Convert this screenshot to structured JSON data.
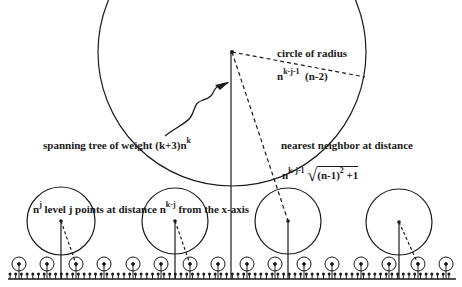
{
  "figure": {
    "big_circle": {
      "cx": 232,
      "cy": 52,
      "r": 134
    },
    "medium_circles": [
      {
        "cx": 61,
        "cy": 221,
        "r": 34
      },
      {
        "cx": 175,
        "cy": 221,
        "r": 33
      },
      {
        "cx": 288,
        "cy": 221,
        "r": 33
      },
      {
        "cx": 399,
        "cy": 222,
        "r": 33
      }
    ],
    "small_circle_centers_x": [
      19,
      47,
      76,
      104,
      133,
      161,
      190,
      218,
      247,
      275,
      304,
      332,
      361,
      389,
      418,
      446
    ],
    "small_circle": {
      "cy": 264,
      "r": 7
    },
    "axis": {
      "y": 279,
      "x1": 8,
      "x2": 456
    },
    "ticks": {
      "spacing": 5.7,
      "top_y": 274
    }
  },
  "labels": {
    "circle_of_radius": "circle of radius",
    "radius_n": "n",
    "radius_exp": "k-j-1",
    "radius_factor": "(n-2)",
    "spanning_tree": "spanning tree of weight (k+3)n",
    "spanning_exp": "k",
    "nearest_neighbor": "nearest  neighbor at distance",
    "nn_n": "n",
    "nn_exp": "k-j-1",
    "nn_sqrt_body": "(n-1)",
    "nn_sqrt_exp": "2",
    "nn_sqrt_tail": "+1",
    "level_n": "n",
    "level_exp": "j",
    "level_text": " level j points at distance n",
    "level_exp2": "k-j",
    "level_tail": "  from the x-axis"
  }
}
